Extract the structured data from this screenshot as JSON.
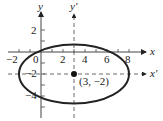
{
  "diagram": {
    "type": "ellipse-graph",
    "axes": {
      "x_label": "x",
      "y_label": "y",
      "x_prime_label": "x′",
      "y_prime_label": "y′",
      "x_ticks": [
        "−2",
        "0",
        "2",
        "4",
        "6",
        "8"
      ],
      "y_ticks": [
        "2",
        "−2",
        "−4"
      ]
    },
    "center": {
      "label": "(3, −2)",
      "x": 3,
      "y": -2
    },
    "ellipse": {
      "h": 3,
      "k": -2,
      "a": 5,
      "b": 3
    },
    "colors": {
      "stroke": "#222222",
      "dashed": "#444444"
    }
  }
}
